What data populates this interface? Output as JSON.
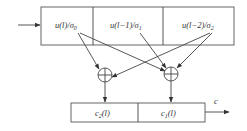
{
  "diagram": {
    "type": "convolutional-encoder",
    "shift_register": {
      "cells": [
        {
          "label": "u(l)/σ",
          "sub": "0"
        },
        {
          "label": "u(l−1)/σ",
          "sub": "1"
        },
        {
          "label": "u(l−2)/σ",
          "sub": "2"
        }
      ]
    },
    "adders": [
      {
        "symbol": "⊕",
        "name": "left"
      },
      {
        "symbol": "⊕",
        "name": "right"
      }
    ],
    "output_register": {
      "cells": [
        {
          "label": "c",
          "sub": "2",
          "suffix": "(l)"
        },
        {
          "label": "c",
          "sub": "1",
          "suffix": "(l)"
        }
      ]
    },
    "output_label": "c",
    "colors": {
      "stroke": "#444444",
      "text": "#333333",
      "background": "#ffffff"
    }
  }
}
